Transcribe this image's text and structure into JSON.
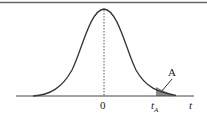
{
  "diagram": {
    "type": "t-distribution density curve with shaded right tail",
    "labels": {
      "origin": "0",
      "critical_value": "t",
      "critical_value_subscript": "A",
      "axis": "t",
      "area": "A"
    },
    "colors": {
      "curve": "#333333",
      "axis": "#444444",
      "shade": "#888888",
      "top_border": "#666666"
    }
  }
}
